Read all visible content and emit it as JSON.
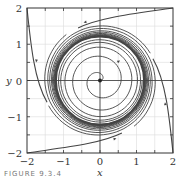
{
  "chart_data": {
    "type": "line",
    "subtype": "phase-portrait",
    "title": "",
    "xlabel": "x",
    "ylabel": "y",
    "xlim": [
      -2,
      2
    ],
    "ylim": [
      -2,
      2
    ],
    "xticks": [
      "-2",
      "-1",
      "0",
      "1",
      "2"
    ],
    "yticks": [
      "-2",
      "-1",
      "0",
      "1",
      "2"
    ],
    "grid": true,
    "minor_grid_step": 0.5,
    "equilibrium": {
      "x": 0,
      "y": 0
    },
    "limit_cycle_radius": 1.2,
    "series": [
      {
        "name": "trajectory from top-right corner",
        "start": [
          2,
          2
        ],
        "direction": "inward counter-clockwise"
      },
      {
        "name": "trajectory from top-left corner",
        "start": [
          -2,
          2
        ],
        "direction": "downward then inward"
      },
      {
        "name": "trajectory from bottom-left corner",
        "start": [
          -2,
          -2
        ],
        "direction": "rightward then inward"
      },
      {
        "name": "trajectory from bottom-right corner",
        "start": [
          2,
          -2
        ],
        "direction": "upward then inward"
      },
      {
        "name": "inner spiral from origin",
        "start": [
          0,
          0
        ],
        "direction": "outward to limit cycle"
      }
    ],
    "colors": {
      "curve": "#444444",
      "grid": "#d8d8d8",
      "frame": "#333333"
    }
  },
  "caption": "FIGURE 9.3.4"
}
